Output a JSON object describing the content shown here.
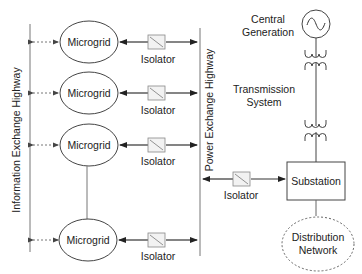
{
  "diagram": {
    "info_highway_label": "Information Exchange Highway",
    "power_highway_label": "Power Exchange Highway",
    "microgrids": [
      {
        "label": "Microgrid",
        "isolator": "Isolator"
      },
      {
        "label": "Microgrid",
        "isolator": "Isolator"
      },
      {
        "label": "Microgrid",
        "isolator": "Isolator"
      },
      {
        "label": "Microgrid",
        "isolator": "Isolator"
      }
    ],
    "central_generation": {
      "line1": "Central",
      "line2": "Generation",
      "icon": "ac-generator-icon"
    },
    "transmission": {
      "line1": "Transmission",
      "line2": "System",
      "icon": "transformer-icon"
    },
    "substation": {
      "label": "Substation",
      "isolator": "Isolator"
    },
    "distribution": {
      "line1": "Distribution",
      "line2": "Network"
    },
    "colors": {
      "stroke": "#333333",
      "text": "#222222",
      "background": "#ffffff"
    }
  }
}
